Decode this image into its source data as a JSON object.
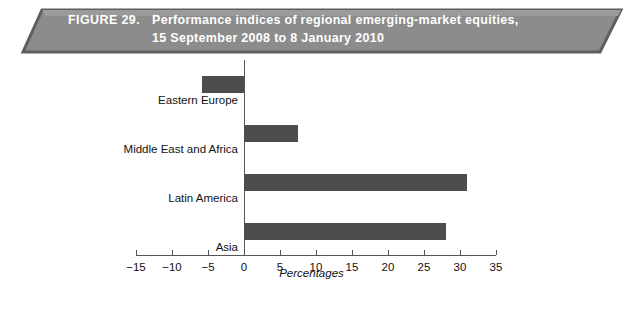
{
  "figure": {
    "number_label": "FIGURE 29.",
    "title_line1": "Performance indices of regional emerging-market equities,",
    "title_line2": "15 September 2008 to 8 January 2010",
    "banner_fill": "#8c8c8c",
    "banner_edge": "#5e5e5e",
    "banner_text_color": "#ffffff"
  },
  "chart_data": {
    "type": "bar",
    "orientation": "horizontal",
    "title": "Performance indices of regional emerging-market equities, 15 September 2008 to 8 January 2010",
    "categories": [
      "Eastern Europe",
      "Middle East and Africa",
      "Latin America",
      "Asia"
    ],
    "values": [
      -5.8,
      7.5,
      31.0,
      28.0
    ],
    "xlabel": "Percentages",
    "ylabel": "",
    "xlim": [
      -15,
      35
    ],
    "xticks": [
      -15,
      -10,
      -5,
      0,
      5,
      10,
      15,
      20,
      25,
      30,
      35
    ],
    "xtick_labels": [
      "−15",
      "−10",
      "−5",
      "0",
      "5",
      "10",
      "15",
      "20",
      "25",
      "30",
      "35"
    ],
    "grid": false,
    "legend": null,
    "bar_color": "#4d4d4d",
    "axis_color": "#555555"
  }
}
